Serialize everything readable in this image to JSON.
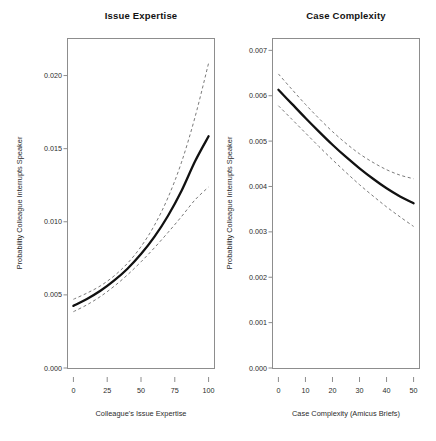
{
  "figure": {
    "width": 436,
    "height": 441,
    "background": "#ffffff",
    "line_color": "#111111",
    "ci_color": "#7a7a7a",
    "axis_color": "#8d8d8d"
  },
  "chart_data": [
    {
      "type": "line",
      "title": "Issue Expertise",
      "xlabel": "Colleague's Issue Expertise",
      "ylabel": "Probability Colleague Interrupts Speaker",
      "xlim": [
        -4,
        104
      ],
      "ylim": [
        0.0,
        0.0225
      ],
      "xticks": [
        0,
        25,
        50,
        75,
        100
      ],
      "xticklabels": [
        "0",
        "25",
        "50",
        "75",
        "100"
      ],
      "yticks": [
        0.0,
        0.005,
        0.01,
        0.015,
        0.02
      ],
      "yticklabels": [
        "0.000",
        "0.005",
        "0.010",
        "0.015",
        "0.020"
      ],
      "grid": false,
      "legend": "none",
      "series": [
        {
          "name": "Predicted probability",
          "style": "solid",
          "x": [
            0,
            10,
            20,
            30,
            40,
            50,
            60,
            70,
            80,
            90,
            100
          ],
          "values": [
            0.00425,
            0.00472,
            0.00528,
            0.00597,
            0.00679,
            0.00779,
            0.00898,
            0.01041,
            0.01212,
            0.01414,
            0.01585
          ]
        },
        {
          "name": "Upper 95% confidence bound",
          "style": "dashed",
          "x": [
            0,
            10,
            20,
            30,
            40,
            50,
            60,
            70,
            80,
            90,
            100
          ],
          "values": [
            0.0047,
            0.00512,
            0.00562,
            0.00629,
            0.00716,
            0.0083,
            0.00977,
            0.01166,
            0.01408,
            0.01717,
            0.02085
          ]
        },
        {
          "name": "Lower 95% confidence bound",
          "style": "dashed",
          "x": [
            0,
            10,
            20,
            30,
            40,
            50,
            60,
            70,
            80,
            90,
            100
          ],
          "values": [
            0.00385,
            0.00432,
            0.00489,
            0.00558,
            0.00637,
            0.00726,
            0.00823,
            0.00927,
            0.01036,
            0.0115,
            0.01238
          ]
        }
      ]
    },
    {
      "type": "line",
      "title": "Case Complexity",
      "xlabel": "Case Complexity (Amicus Briefs)",
      "ylabel": "Probability Colleague Interrupts Speaker",
      "xlim": [
        -2,
        52
      ],
      "ylim": [
        0.0,
        0.00725
      ],
      "xticks": [
        0,
        10,
        20,
        30,
        40,
        50
      ],
      "xticklabels": [
        "0",
        "10",
        "20",
        "30",
        "40",
        "50"
      ],
      "yticks": [
        0.0,
        0.001,
        0.002,
        0.003,
        0.004,
        0.005,
        0.006,
        0.007
      ],
      "yticklabels": [
        "0.000",
        "0.001",
        "0.002",
        "0.003",
        "0.004",
        "0.005",
        "0.006",
        "0.007"
      ],
      "grid": false,
      "legend": "none",
      "series": [
        {
          "name": "Predicted probability",
          "style": "solid",
          "x": [
            0,
            5,
            10,
            15,
            20,
            25,
            30,
            35,
            40,
            45,
            50
          ],
          "values": [
            0.00613,
            0.00582,
            0.00551,
            0.00521,
            0.00492,
            0.00465,
            0.0044,
            0.00417,
            0.00396,
            0.00378,
            0.00363
          ]
        },
        {
          "name": "Upper 95% confidence bound",
          "style": "dashed",
          "x": [
            0,
            5,
            10,
            15,
            20,
            25,
            30,
            35,
            40,
            45,
            50
          ],
          "values": [
            0.00648,
            0.00614,
            0.00581,
            0.0055,
            0.00521,
            0.00495,
            0.00472,
            0.00453,
            0.00437,
            0.00425,
            0.00417
          ]
        },
        {
          "name": "Lower 95% confidence bound",
          "style": "dashed",
          "x": [
            0,
            5,
            10,
            15,
            20,
            25,
            30,
            35,
            40,
            45,
            50
          ],
          "values": [
            0.00578,
            0.00548,
            0.00518,
            0.00488,
            0.00459,
            0.00431,
            0.00404,
            0.00379,
            0.00355,
            0.00333,
            0.00312
          ]
        }
      ]
    }
  ]
}
